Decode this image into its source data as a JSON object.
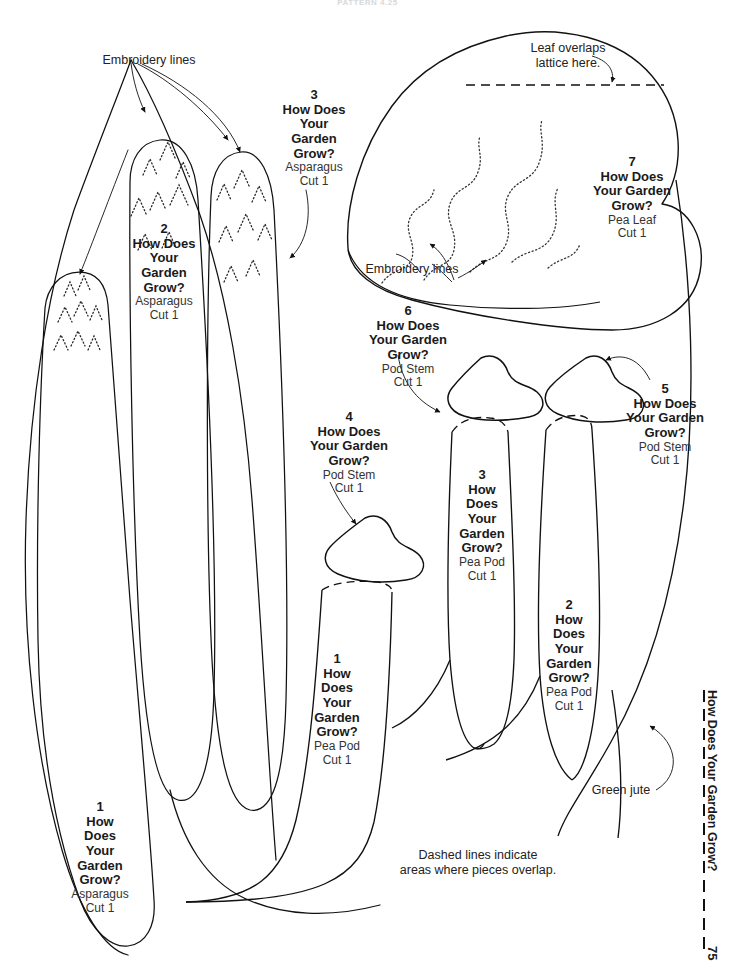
{
  "page": {
    "faint_header": "PATTERN 4.25",
    "number": "75",
    "running_head": "How Does Your Garden Grow?"
  },
  "notes": [
    {
      "key": "embroidery_top_left",
      "text": "Embroidery lines"
    },
    {
      "key": "leaf_overlaps",
      "text": "Leaf overlaps\nlattice here."
    },
    {
      "key": "embroidery_leaf",
      "text": "Embroidery lines"
    },
    {
      "key": "green_jute",
      "text": "Green jute"
    },
    {
      "key": "dashed_legend",
      "text": "Dashed lines indicate\nareas where pieces overlap."
    }
  ],
  "pieces": [
    {
      "num": "3",
      "title": "How Does\nYour\nGarden\nGrow?",
      "part": "Asparagus",
      "cut": "Cut 1"
    },
    {
      "num": "2",
      "title": "How Does\nYour\nGarden\nGrow?",
      "part": "Asparagus",
      "cut": "Cut 1"
    },
    {
      "num": "7",
      "title": "How Does\nYour Garden\nGrow?",
      "part": "Pea Leaf",
      "cut": "Cut 1"
    },
    {
      "num": "6",
      "title": "How Does\nYour Garden\nGrow?",
      "part": "Pod Stem",
      "cut": "Cut 1"
    },
    {
      "num": "5",
      "title": "How Does\nYour Garden\nGrow?",
      "part": "Pod Stem",
      "cut": "Cut 1"
    },
    {
      "num": "4",
      "title": "How Does\nYour Garden\nGrow?",
      "part": "Pod Stem",
      "cut": "Cut 1"
    },
    {
      "num": "3",
      "title": "How\nDoes\nYour\nGarden\nGrow?",
      "part": "Pea Pod",
      "cut": "Cut 1"
    },
    {
      "num": "2",
      "title": "How\nDoes\nYour\nGarden\nGrow?",
      "part": "Pea Pod",
      "cut": "Cut 1"
    },
    {
      "num": "1",
      "title": "How\nDoes\nYour\nGarden\nGrow?",
      "part": "Pea Pod",
      "cut": "Cut 1"
    },
    {
      "num": "1",
      "title": "How\nDoes\nYour\nGarden\nGrow?",
      "part": "Asparagus",
      "cut": "Cut 1"
    }
  ],
  "colors": {
    "ink": "#111111",
    "paper": "#ffffff",
    "subtext": "#333333"
  }
}
